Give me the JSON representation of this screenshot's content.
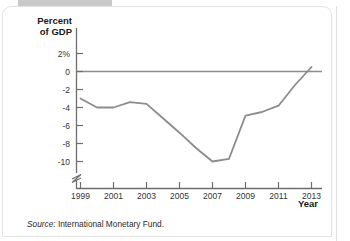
{
  "panel": {
    "tab_label": ""
  },
  "chart_data": {
    "type": "line",
    "title": "",
    "ylabel_line1": "Percent",
    "ylabel_line2": "of GDP",
    "xlabel": "Year",
    "x": [
      1999,
      2000,
      2001,
      2002,
      2003,
      2004,
      2005,
      2006,
      2007,
      2008,
      2009,
      2010,
      2011,
      2012,
      2013
    ],
    "values": [
      -3.0,
      -4.0,
      -4.0,
      -3.4,
      -3.6,
      -5.2,
      -6.8,
      -8.5,
      -10.0,
      -9.7,
      -4.9,
      -4.5,
      -3.8,
      -1.5,
      0.5
    ],
    "series": [
      {
        "name": "Budget balance as percent of GDP",
        "values": [
          -3.0,
          -4.0,
          -4.0,
          -3.4,
          -3.6,
          -5.2,
          -6.8,
          -8.5,
          -10.0,
          -9.7,
          -4.9,
          -4.5,
          -3.8,
          -1.5,
          0.5
        ]
      }
    ],
    "ytick_labels": [
      "2%",
      "0",
      "-2",
      "-4",
      "-6",
      "-8",
      "-10"
    ],
    "ytick_values": [
      2,
      0,
      -2,
      -4,
      -6,
      -8,
      -10
    ],
    "xtick_labels": [
      "1999",
      "2001",
      "2003",
      "2005",
      "2007",
      "2009",
      "2011",
      "2013"
    ],
    "xtick_values": [
      1999,
      2001,
      2003,
      2005,
      2007,
      2009,
      2011,
      2013
    ],
    "ylim": [
      -10,
      2
    ],
    "xlim": [
      1999,
      2013.3
    ],
    "grid": false,
    "legend": "none",
    "axis_break": "y-axis break below -10",
    "line_color": "#8c8c8c",
    "zero_line_color": "#8c8c8c",
    "axis_color": "#6e6e6e"
  },
  "footer": {
    "source_word": "Source:",
    "source_text": " International Monetary Fund."
  }
}
